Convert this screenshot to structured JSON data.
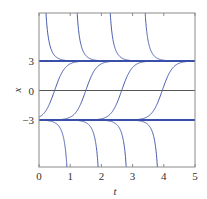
{
  "chart_data": {
    "type": "line",
    "title": "",
    "xlabel": "t",
    "ylabel": "x",
    "xlim": [
      0,
      5
    ],
    "ylim": [
      -7.9,
      7.9
    ],
    "xticks": [
      0,
      1,
      2,
      3,
      4,
      5
    ],
    "xtick_labels": [
      "0",
      "1",
      "2",
      "3",
      "4",
      "5"
    ],
    "yticks": [
      3,
      0,
      -3
    ],
    "ytick_labels": [
      "3",
      "0",
      "−3"
    ],
    "grid": false,
    "legend": null,
    "equilibria": [
      3,
      -3
    ],
    "zero_line": 0,
    "series": [
      {
        "name": "above x=3 (decreasing to 3)",
        "form": "3*coth(3*(t-a))",
        "params": [
          0.09,
          1.09,
          2.15,
          3.27
        ]
      },
      {
        "name": "between -3 and 3 (increasing to 3)",
        "form": "3*tanh(3*(t-c))",
        "params": [
          0.5,
          1.5,
          2.65,
          3.95
        ]
      },
      {
        "name": "below x=-3 (decreasing to -inf)",
        "form": "3*coth(3*(t-b))",
        "params": [
          1.03,
          2.03,
          2.93,
          3.93
        ]
      }
    ],
    "colors": {
      "curve": "#4a5cb0",
      "equilibrium": "#3a4fa8",
      "zero_line": "#555555",
      "frame": "#8a8a8a"
    }
  }
}
